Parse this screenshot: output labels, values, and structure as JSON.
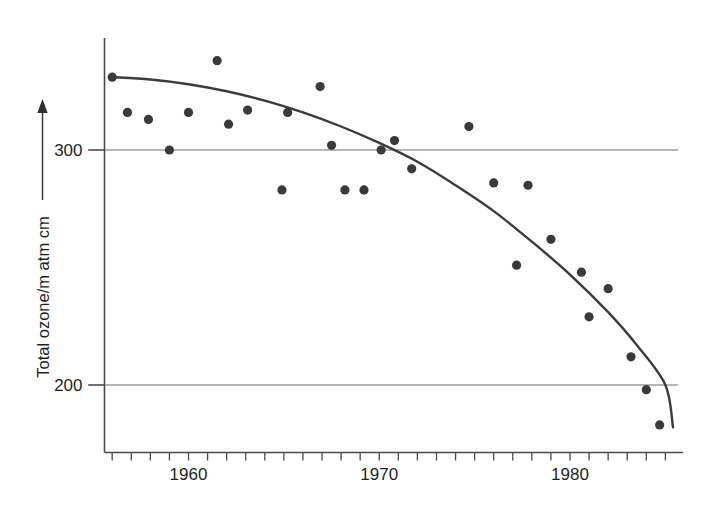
{
  "chart_data": {
    "type": "scatter",
    "title": "",
    "subtitle": "",
    "xlabel": "",
    "ylabel": "Total ozone/m atm cm",
    "xlim": [
      1955.2,
      1985.5
    ],
    "ylim": [
      176,
      345
    ],
    "xticks": [
      1956,
      1957,
      1958,
      1959,
      1960,
      1961,
      1962,
      1963,
      1964,
      1965,
      1966,
      1967,
      1968,
      1969,
      1970,
      1971,
      1972,
      1973,
      1974,
      1975,
      1976,
      1977,
      1978,
      1979,
      1980,
      1981,
      1982,
      1983,
      1984,
      1985
    ],
    "xtick_labels": [
      {
        "value": 1960,
        "label": "1960"
      },
      {
        "value": 1970,
        "label": "1970"
      },
      {
        "value": 1980,
        "label": "1980"
      }
    ],
    "yticks": [
      200,
      300
    ],
    "ytick_labels": [
      {
        "value": 300,
        "label": "300"
      },
      {
        "value": 200,
        "label": "200"
      }
    ],
    "grid": "horizontal-at-yticks",
    "legend": "none",
    "series": [
      {
        "name": "Measured total ozone",
        "type": "scatter",
        "marker": "filled-circle",
        "color": "#3a3a3a",
        "points": [
          {
            "x": 1956.0,
            "y": 331
          },
          {
            "x": 1956.8,
            "y": 316
          },
          {
            "x": 1957.9,
            "y": 313
          },
          {
            "x": 1959.0,
            "y": 300
          },
          {
            "x": 1960.0,
            "y": 316
          },
          {
            "x": 1961.5,
            "y": 338
          },
          {
            "x": 1962.1,
            "y": 311
          },
          {
            "x": 1963.1,
            "y": 317
          },
          {
            "x": 1964.9,
            "y": 283
          },
          {
            "x": 1965.2,
            "y": 316
          },
          {
            "x": 1966.9,
            "y": 327
          },
          {
            "x": 1967.5,
            "y": 302
          },
          {
            "x": 1968.2,
            "y": 283
          },
          {
            "x": 1969.2,
            "y": 283
          },
          {
            "x": 1970.1,
            "y": 300
          },
          {
            "x": 1970.8,
            "y": 304
          },
          {
            "x": 1971.7,
            "y": 292
          },
          {
            "x": 1974.7,
            "y": 310
          },
          {
            "x": 1976.0,
            "y": 286
          },
          {
            "x": 1977.2,
            "y": 251
          },
          {
            "x": 1977.8,
            "y": 285
          },
          {
            "x": 1979.0,
            "y": 262
          },
          {
            "x": 1980.6,
            "y": 248
          },
          {
            "x": 1981.0,
            "y": 229
          },
          {
            "x": 1982.0,
            "y": 241
          },
          {
            "x": 1983.2,
            "y": 212
          },
          {
            "x": 1984.0,
            "y": 198
          },
          {
            "x": 1984.7,
            "y": 183
          }
        ]
      },
      {
        "name": "Fitted trend curve",
        "type": "line",
        "color": "#3b3b3b",
        "points": [
          {
            "x": 1956.0,
            "y": 331
          },
          {
            "x": 1958.0,
            "y": 330
          },
          {
            "x": 1960.0,
            "y": 328
          },
          {
            "x": 1962.0,
            "y": 325
          },
          {
            "x": 1964.0,
            "y": 321
          },
          {
            "x": 1966.0,
            "y": 316
          },
          {
            "x": 1968.0,
            "y": 310
          },
          {
            "x": 1970.0,
            "y": 303
          },
          {
            "x": 1972.0,
            "y": 295
          },
          {
            "x": 1974.0,
            "y": 285
          },
          {
            "x": 1976.0,
            "y": 274
          },
          {
            "x": 1978.0,
            "y": 261
          },
          {
            "x": 1980.0,
            "y": 247
          },
          {
            "x": 1982.0,
            "y": 231
          },
          {
            "x": 1983.5,
            "y": 217
          },
          {
            "x": 1985.0,
            "y": 200
          },
          {
            "x": 1985.4,
            "y": 182
          }
        ]
      }
    ]
  },
  "axes": {
    "y_arrow_label": "Total ozone/m atm cm",
    "y_tick_300": "300",
    "y_tick_200": "200",
    "x_tick_1960": "1960",
    "x_tick_1970": "1970",
    "x_tick_1980": "1980"
  },
  "colors": {
    "point": "#3a3a3a",
    "curve": "#3b3b3b",
    "axis": "#4a4a4a",
    "grid": "#6e6e6e",
    "text": "#1f1f1f",
    "background": "#ffffff"
  }
}
